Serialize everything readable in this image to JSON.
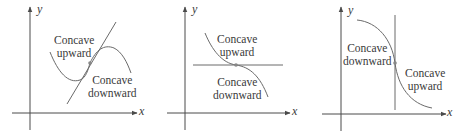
{
  "figure": {
    "colors": {
      "axis": "#4a4a4a",
      "curve": "#6a6a6a",
      "tangent": "#6a6a6a",
      "point": "#888888",
      "text": "#3a3a3a"
    },
    "panels": [
      {
        "id": "panel-1",
        "x_axis_label": "x",
        "y_axis_label": "y",
        "tangent": "oblique",
        "labels": {
          "upper_line1": "Concave",
          "upper_line2": "upward",
          "lower_line1": "Concave",
          "lower_line2": "downward"
        }
      },
      {
        "id": "panel-2",
        "x_axis_label": "x",
        "y_axis_label": "y",
        "tangent": "horizontal",
        "labels": {
          "upper_line1": "Concave",
          "upper_line2": "upward",
          "lower_line1": "Concave",
          "lower_line2": "downward"
        }
      },
      {
        "id": "panel-3",
        "x_axis_label": "x",
        "y_axis_label": "y",
        "tangent": "vertical",
        "labels": {
          "left_line1": "Concave",
          "left_line2": "downward",
          "right_line1": "Concave",
          "right_line2": "upward"
        }
      }
    ]
  }
}
